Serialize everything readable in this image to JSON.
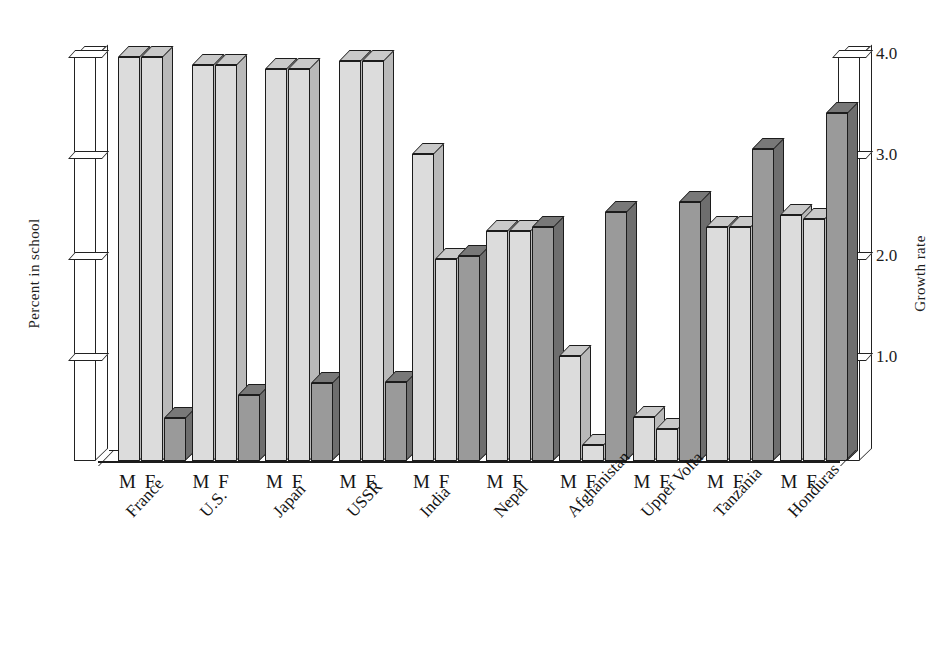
{
  "chart_data": {
    "type": "bar",
    "title": "",
    "subtitle": "",
    "categories": [
      "France",
      "U.S.",
      "Japan",
      "USSR",
      "India",
      "Nepal",
      "Afghanistan",
      "Upper Volta",
      "Tanzania",
      "Honduras"
    ],
    "group_tick_labels": [
      "M",
      "F"
    ],
    "series": [
      {
        "name": "Male percent in school",
        "axis": "left",
        "shade": "light",
        "values": [
          100,
          98,
          97,
          99,
          76,
          57,
          26,
          11,
          58,
          61
        ]
      },
      {
        "name": "Female percent in school",
        "axis": "left",
        "shade": "light",
        "values": [
          100,
          98,
          97,
          99,
          50,
          57,
          4,
          8,
          58,
          60
        ]
      },
      {
        "name": "Growth rate",
        "axis": "right",
        "shade": "dark",
        "values": [
          0.43,
          0.65,
          0.77,
          0.78,
          2.03,
          2.32,
          2.47,
          2.56,
          3.09,
          3.45
        ]
      }
    ],
    "left_axis": {
      "label": "Percent in school",
      "ticks": [
        25,
        50,
        75,
        100
      ],
      "tick_labels": [
        "25",
        "50",
        "75",
        "100"
      ],
      "range": [
        0,
        100
      ]
    },
    "right_axis": {
      "label": "Growth rate",
      "ticks": [
        1.0,
        2.0,
        3.0,
        4.0
      ],
      "tick_labels": [
        "1.0",
        "2.0",
        "3.0",
        "4.0"
      ],
      "range": [
        0,
        4.0
      ]
    },
    "grid": false,
    "legend": "none",
    "colors": {
      "light_bar": "#dcdcdc",
      "dark_bar": "#9a9a9a",
      "outline": "#1c1c1c",
      "background": "#ffffff"
    }
  }
}
